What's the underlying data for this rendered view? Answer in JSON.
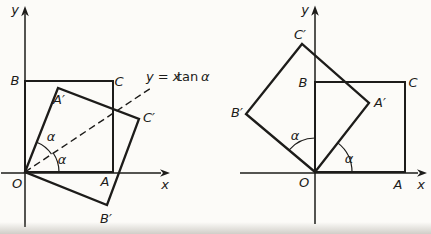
{
  "palette": {
    "ink": "#1d1c1a",
    "paper": "#fcfbf8"
  },
  "left_figure": {
    "axis": {
      "x_label": "x",
      "y_label": "y"
    },
    "origin_label": "O",
    "square": {
      "a": "A",
      "b": "B",
      "c": "C"
    },
    "image_square": {
      "a_prime": "A′",
      "b_prime": "B′",
      "c_prime": "C′"
    },
    "angles": {
      "upper": "α",
      "lower": "α"
    },
    "equation": {
      "lhs": "y = x",
      "fn": "tan",
      "arg": "α"
    }
  },
  "right_figure": {
    "axis": {
      "x_label": "x",
      "y_label": "y"
    },
    "origin_label": "O",
    "square": {
      "a": "A",
      "b": "B",
      "c": "C"
    },
    "image_square": {
      "a_prime": "A′",
      "b_prime": "B′",
      "c_prime": "C′"
    },
    "angles": {
      "left": "α",
      "right": "α"
    }
  }
}
